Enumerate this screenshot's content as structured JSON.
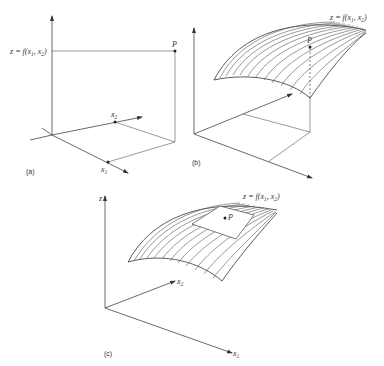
{
  "figure": {
    "panels": [
      {
        "id": "a",
        "label": "(a)",
        "function_label": "z = f(x1, x2)",
        "point_label": "P",
        "axes": {
          "x1": "x1",
          "x2": "x2"
        }
      },
      {
        "id": "b",
        "label": "(b)",
        "function_label": "z = f(x1, x2)",
        "point_label": "P"
      },
      {
        "id": "c",
        "label": "(c)",
        "function_label": "z = f(x1, x2)",
        "point_label": "P",
        "axes": {
          "z": "z",
          "x1": "x1",
          "x2": "x2"
        }
      }
    ]
  },
  "text": {
    "a_label": "(a)",
    "b_label": "(b)",
    "c_label": "(c)",
    "z": "z",
    "f_eq": " = f(",
    "x": "x",
    "sub1": "1",
    "sub2": "2",
    "comma": ", ",
    "close": ")",
    "P": "P"
  }
}
